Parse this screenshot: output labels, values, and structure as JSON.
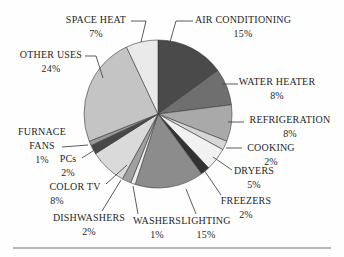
{
  "chart_data": {
    "type": "pie",
    "title": "",
    "unit": "%",
    "direction": "clockwise",
    "start_angle_deg": 0,
    "legend": "none",
    "label_style": "callouts-with-leader-lines",
    "slices": [
      {
        "label": "AIR CONDITIONING",
        "value": 15,
        "pct_label": "15%",
        "color": "#4a4a4a"
      },
      {
        "label": "WATER HEATER",
        "value": 8,
        "pct_label": "8%",
        "color": "#6f6f6f"
      },
      {
        "label": "REFRIGERATION",
        "value": 8,
        "pct_label": "8%",
        "color": "#a9a9a9"
      },
      {
        "label": "COOKING",
        "value": 2,
        "pct_label": "2%",
        "color": "#d6d6d6"
      },
      {
        "label": "DRYERS",
        "value": 5,
        "pct_label": "5%",
        "color": "#f1f1f1"
      },
      {
        "label": "FREEZERS",
        "value": 2,
        "pct_label": "2%",
        "color": "#323232"
      },
      {
        "label": "LIGHTING",
        "value": 15,
        "pct_label": "15%",
        "color": "#8c8c8c"
      },
      {
        "label": "WASHERS",
        "value": 1,
        "pct_label": "1%",
        "color": "#ededed"
      },
      {
        "label": "DISHWASHERS",
        "value": 2,
        "pct_label": "2%",
        "color": "#a0a0a0"
      },
      {
        "label": "COLOR TV",
        "value": 8,
        "pct_label": "8%",
        "color": "#dadada"
      },
      {
        "label": "PCs",
        "value": 2,
        "pct_label": "2%",
        "color": "#484848"
      },
      {
        "label": "FURNACE FANS",
        "value": 1,
        "pct_label": "1%",
        "color": "#989898"
      },
      {
        "label": "OTHER USES",
        "value": 24,
        "pct_label": "24%",
        "color": "#c4c4c4"
      },
      {
        "label": "SPACE HEAT",
        "value": 7,
        "pct_label": "7%",
        "color": "#eaeaea"
      }
    ],
    "colors": {
      "slice_outline": "#3a3a3a",
      "leader_line": "#4a4a4a",
      "text": "#1f1f1f",
      "bottom_rule": "#b7b7b7"
    }
  }
}
